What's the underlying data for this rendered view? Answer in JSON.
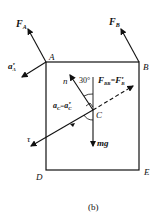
{
  "diagram": {
    "caption": "(b)",
    "points": {
      "A": "A",
      "B": "B",
      "C": "C",
      "D": "D",
      "E": "E"
    },
    "forces": {
      "FA": "F",
      "FA_sub": "A",
      "FB": "F",
      "FB_sub": "B",
      "aA": "a",
      "aA_sub": "A",
      "aA_sup": "τ",
      "FBR": "F",
      "FBR_sub": "BR",
      "FBR_eq": "=",
      "FBR_rhs": "F",
      "FBR_rhs_sub": "B",
      "FBR_rhs_sup": "τ",
      "aC": "a",
      "aC_sub": "C",
      "aC_eq": "=",
      "aC_rhs": "a",
      "aC_rhs_sub": "C",
      "aC_rhs_sup": "τ",
      "mg": "mg",
      "n": "n",
      "tau": "τ",
      "angle": "30°"
    }
  }
}
